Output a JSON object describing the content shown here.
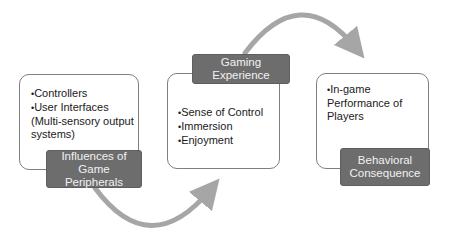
{
  "diagram": {
    "nodes": [
      {
        "id": "influences",
        "label": "Influences of Game Peripherals",
        "bullets": [
          "Controllers",
          "User Interfaces (Multi-sensory output systems)"
        ]
      },
      {
        "id": "experience",
        "label": "Gaming Experience",
        "bullets": [
          "Sense of Control",
          "Immersion",
          "Enjoyment"
        ]
      },
      {
        "id": "consequence",
        "label": "Behavioral Consequence",
        "bullets": [
          "In-game Performance of Players"
        ]
      }
    ],
    "edges": [
      {
        "from": "influences",
        "to": "experience",
        "style": "curved-arrow-bottom"
      },
      {
        "from": "experience",
        "to": "consequence",
        "style": "curved-arrow-top"
      }
    ],
    "colors": {
      "label_bg": "#6d6d6d",
      "label_text": "#f2f2f2",
      "box_border": "#7f7f7f",
      "arrow": "#a6a6a6"
    }
  }
}
